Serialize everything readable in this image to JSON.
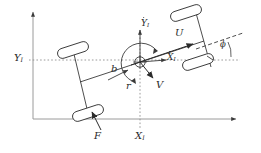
{
  "figure": {
    "type": "vehicle-kinematics-diagram",
    "stroke_color": "#3a3a3a",
    "text_color": "#2b2b2b",
    "background": "#ffffff"
  },
  "inertial_frame": {
    "y_axis_label": "Y",
    "y_axis_sub": "I",
    "x_axis_label": "X",
    "x_axis_sub": "I",
    "y_gridline_style": "dotted",
    "x_gridline_style": "dotted"
  },
  "body_frame": {
    "y_axis_label": "Y",
    "y_axis_sub": "I",
    "y_axis_accent": "dot",
    "x_axis_label": "X",
    "x_axis_sub": "I",
    "x_axis_accent": "dot",
    "origin_marker": "circle-with-crosshair"
  },
  "vectors": {
    "longitudinal_velocity": "U",
    "lateral_velocity": "V",
    "yaw_rate": "r",
    "force": "F"
  },
  "dimensions": {
    "wheelbase_offset": "b"
  },
  "angles": {
    "heading": "ϕ"
  },
  "wheels": [
    {
      "name": "front-left-wheel"
    },
    {
      "name": "front-right-wheel"
    },
    {
      "name": "rear-left-wheel"
    },
    {
      "name": "rear-right-wheel"
    }
  ]
}
